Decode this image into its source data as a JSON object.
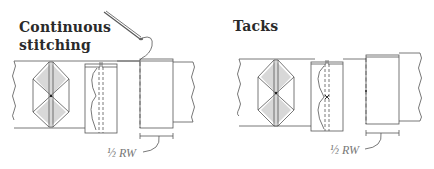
{
  "panels": [
    {
      "id": "continuous",
      "title_line1": "Continuous",
      "title_line2": "stitching",
      "measure_label": "½ RW"
    },
    {
      "id": "tacks",
      "title_line1": "Tacks",
      "measure_label": "½ RW"
    }
  ],
  "colors": {
    "line": "#555555",
    "fill": "#d8d8d8",
    "text": "#2a2a2a",
    "label": "#777777"
  }
}
